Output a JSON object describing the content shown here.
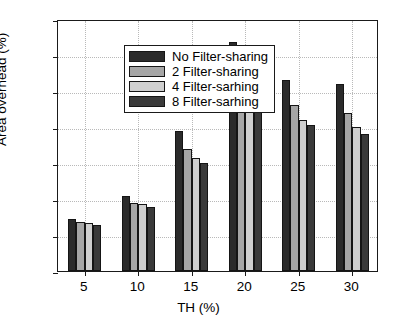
{
  "chart_data": {
    "type": "bar",
    "title": "",
    "xlabel": "TH (%)",
    "ylabel": "Area overhead (%)",
    "categories": [
      "5",
      "10",
      "15",
      "20",
      "25",
      "30"
    ],
    "xlim": [
      0,
      6
    ],
    "ylim": [
      0,
      14
    ],
    "ytick_labels": [
      "0",
      "2",
      "4",
      "6",
      "8",
      "10",
      "12",
      "14"
    ],
    "ytick_values": [
      0,
      2,
      4,
      6,
      8,
      10,
      12,
      14
    ],
    "xtick_labels": [
      "5",
      "10",
      "15",
      "20",
      "25",
      "30"
    ],
    "grid": true,
    "legend_position": "upper-left",
    "series": [
      {
        "name": "No Filter-sharing",
        "color": "#2b2b2b",
        "values": [
          2.9,
          4.15,
          7.8,
          12.7,
          10.6,
          10.4
        ]
      },
      {
        "name": "2 Filter-sharing",
        "color": "#a6a6a6",
        "values": [
          2.75,
          3.8,
          6.8,
          10.8,
          9.2,
          8.8
        ]
      },
      {
        "name": "4 Filter-sarhing",
        "color": "#cfcfcf",
        "values": [
          2.65,
          3.7,
          6.3,
          9.9,
          8.4,
          8.0
        ]
      },
      {
        "name": "8 Filter-sarhing",
        "color": "#3a3a3a",
        "values": [
          2.55,
          3.55,
          6.0,
          9.4,
          8.1,
          7.6
        ]
      }
    ]
  },
  "legend": {
    "items": [
      {
        "label": "No Filter-sharing",
        "color": "#2b2b2b"
      },
      {
        "label": "2 Filter-sharing",
        "color": "#a6a6a6"
      },
      {
        "label": "4 Filter-sarhing",
        "color": "#cfcfcf"
      },
      {
        "label": "8 Filter-sarhing",
        "color": "#3a3a3a"
      }
    ]
  },
  "axes": {
    "y_title": "Area overhead (%)",
    "x_title": "TH (%)"
  }
}
